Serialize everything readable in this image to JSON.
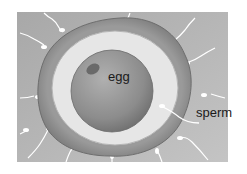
{
  "diagram": {
    "type": "biology-illustration",
    "labels": {
      "egg": "egg",
      "sperm": "sperm"
    },
    "colors": {
      "background": "#b8b8b8",
      "outer_layer": "#8a8a8a",
      "zona": "#e6e6e6",
      "egg": "#8c8c8c",
      "nucleus": "#6a6a6a",
      "sperm": "#ffffff",
      "text": "#1a1a1a"
    }
  }
}
